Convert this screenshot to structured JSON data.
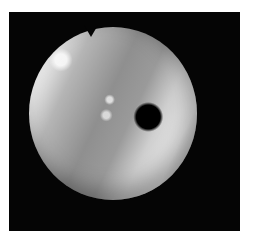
{
  "image": {
    "description": "Grayscale circular endoscopic view inside a black square frame on white background",
    "elements": [
      "black-frame",
      "circular-scope-view",
      "dark-lumen-opening",
      "specular-highlights",
      "notch-at-top"
    ]
  }
}
